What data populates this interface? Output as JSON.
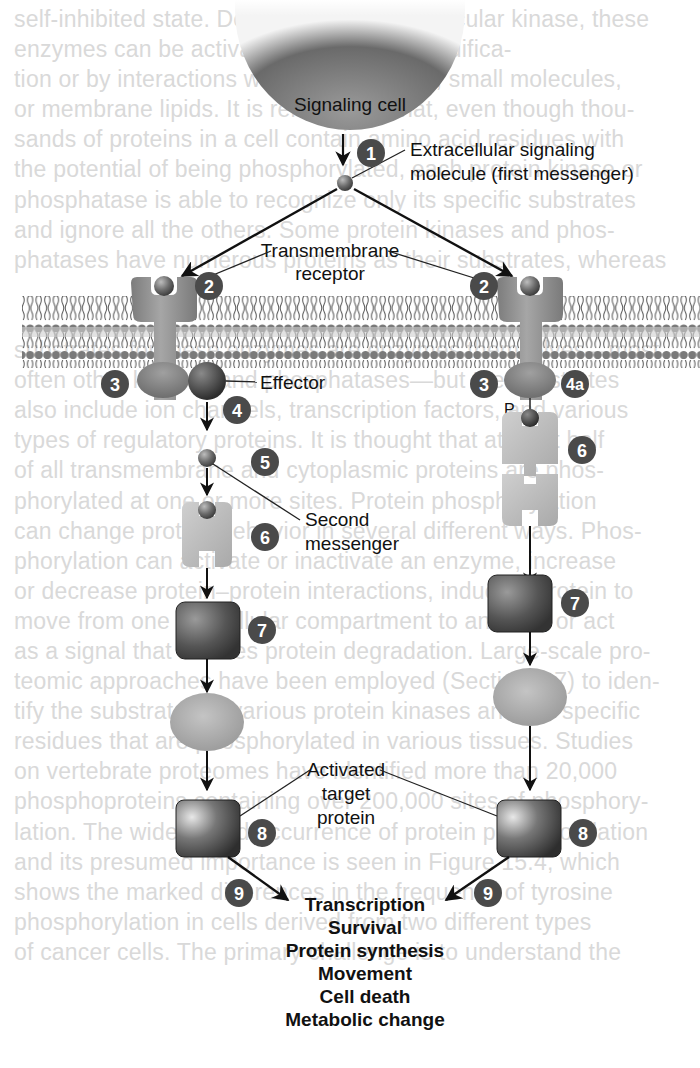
{
  "background_text": {
    "lines": [
      "self-inhibited state. Depending on the particular kinase, these",
      "enzymes can be activated by covalent modifica-",
      "tion or by interactions with other proteins, small molecules,",
      "or membrane lipids. It is remarkable that, even though thou-",
      "sands of proteins in a cell contain amino acid residues with",
      "the potential of being phosphorylated, each protein kinase or",
      "phosphatase is able to recognize only its specific substrates",
      "and ignore all the others. Some protein kinases and phos-",
      "phatases have numerous proteins as their substrates, whereas",
      "",
      "",
      "substrates for these enzymes are enzymes themselves—most",
      "often other kinases and phosphatases—but the substrates",
      "also include ion channels, transcription factors, and various",
      "types of regulatory proteins. It is thought that at least half",
      "of all transmembrane and cytoplasmic proteins are phos-",
      "phorylated at one or more sites. Protein phosphorylation",
      "can change protein behavior in several different ways. Phos-",
      "phorylation can activate or inactivate an enzyme, increase",
      "or decrease protein–protein interactions, induce a protein to",
      "move from one subcellular compartment to another, or act",
      "as a signal that initiates protein degradation. Large-scale pro-",
      "teomic approaches have been employed (Section 2.7) to iden-",
      "tify the substrates of various protein kinases and the specific",
      "residues that are phosphorylated in various tissues. Studies",
      "on vertebrate proteomes have identified more than 20,000",
      "phosphoproteins containing over 200,000 sites of phosphory-",
      "lation. The widespread occurrence of protein phosphorylation",
      "and its presumed importance is seen in Figure 15.4, which",
      "shows the marked differences in the frequency of tyrosine",
      "phosphorylation in cells derived from two different types",
      "of cancer cells. The primary challenge is to understand the"
    ]
  },
  "diagram": {
    "signaling_cell_label": "Signaling cell",
    "first_messenger_label_line1": "Extracellular signaling",
    "first_messenger_label_line2": "molecule (first messenger)",
    "receptor_label_line1": "Transmembrane",
    "receptor_label_line2": "receptor",
    "effector_label": "Effector",
    "second_messenger_label_line1": "Second",
    "second_messenger_label_line2": "messenger",
    "phosphate_label": "P",
    "target_label_line1": "Activated",
    "target_label_line2": "target",
    "target_label_line3": "protein",
    "badges": {
      "b1": "1",
      "b2l": "2",
      "b2r": "2",
      "b3l": "3",
      "b3r": "3",
      "b4": "4",
      "b4a": "4a",
      "b5": "5",
      "b6l": "6",
      "b6r": "6",
      "b7l": "7",
      "b7r": "7",
      "b8l": "8",
      "b8r": "8",
      "b9l": "9",
      "b9r": "9"
    },
    "outcomes": [
      "Transcription",
      "Survival",
      "Protein synthesis",
      "Movement",
      "Cell death",
      "Metabolic change"
    ],
    "colors": {
      "badge": "#4a4a4a",
      "receptor": "#8c8c8c",
      "membrane_head": "#777777",
      "block": "#4f4f4f",
      "ellipse": "#a8a8a8",
      "arrow": "#111111"
    }
  }
}
